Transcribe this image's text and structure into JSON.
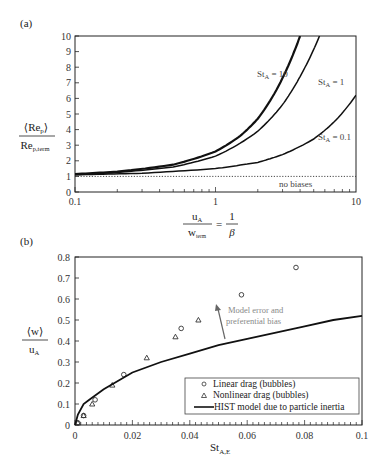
{
  "chart_data": [
    {
      "panel": "(a)",
      "type": "line",
      "xscale": "log",
      "xlim": [
        0.1,
        10
      ],
      "ylim": [
        0,
        10
      ],
      "x_ticks": [
        "0.1",
        "1",
        "10"
      ],
      "y_ticks": [
        "0",
        "1",
        "2",
        "3",
        "4",
        "5",
        "6",
        "7",
        "8",
        "9",
        "10"
      ],
      "ylabel": "⟨Re_p⟩ / Re_p,term",
      "xlabel": "u_A / w_term = 1/β",
      "grid": false,
      "series": [
        {
          "name": "St_A = 10",
          "x": [
            0.1,
            0.2,
            0.5,
            1,
            1.5,
            2,
            3,
            4
          ],
          "y": [
            1.15,
            1.3,
            1.75,
            2.6,
            3.6,
            4.7,
            7.3,
            10
          ]
        },
        {
          "name": "St_A = 1",
          "x": [
            0.1,
            0.2,
            0.5,
            1,
            2,
            3,
            4,
            5.5
          ],
          "y": [
            1.12,
            1.25,
            1.6,
            2.3,
            3.9,
            5.6,
            7.4,
            10
          ]
        },
        {
          "name": "St_A = 0.1",
          "x": [
            0.1,
            0.3,
            1,
            2,
            3,
            5,
            7,
            10
          ],
          "y": [
            1.1,
            1.2,
            1.5,
            1.9,
            2.4,
            3.4,
            4.5,
            6.2
          ]
        },
        {
          "name": "no biases",
          "x": [
            0.1,
            10
          ],
          "y": [
            1,
            1
          ],
          "style": "dotted"
        }
      ],
      "annotations": [
        "St_A = 10",
        "St_A = 1",
        "St_A = 0.1",
        "no biases"
      ]
    },
    {
      "panel": "(b)",
      "type": "scatter",
      "xlim": [
        0,
        0.1
      ],
      "ylim": [
        0,
        0.8
      ],
      "x_ticks": [
        "0",
        "0.02",
        "0.04",
        "0.06",
        "0.08",
        "0.1"
      ],
      "y_ticks": [
        "0",
        "0.1",
        "0.2",
        "0.3",
        "0.4",
        "0.5",
        "0.6",
        "0.7",
        "0.8"
      ],
      "ylabel": "⟨w⟩ / u_A",
      "xlabel": "St_A,E",
      "grid": false,
      "series": [
        {
          "name": "Linear drag (bubbles)",
          "marker": "circle",
          "x": [
            0.001,
            0.003,
            0.007,
            0.017,
            0.037,
            0.058,
            0.077
          ],
          "y": [
            0.01,
            0.045,
            0.12,
            0.24,
            0.46,
            0.62,
            0.75
          ]
        },
        {
          "name": "Nonlinear drag (bubbles)",
          "marker": "triangle",
          "x": [
            0.001,
            0.003,
            0.006,
            0.013,
            0.025,
            0.035,
            0.043
          ],
          "y": [
            0.01,
            0.045,
            0.1,
            0.19,
            0.32,
            0.42,
            0.5
          ]
        },
        {
          "name": "HIST model due to particle inertia",
          "marker": "line",
          "x": [
            0,
            0.001,
            0.003,
            0.005,
            0.01,
            0.02,
            0.03,
            0.04,
            0.05,
            0.06,
            0.07,
            0.08,
            0.09,
            0.1
          ],
          "y": [
            0,
            0.05,
            0.1,
            0.12,
            0.17,
            0.25,
            0.3,
            0.34,
            0.38,
            0.41,
            0.44,
            0.47,
            0.5,
            0.52
          ]
        }
      ],
      "annotations": [
        "Model error and",
        "preferential bias"
      ],
      "legend_position": "lower right"
    }
  ],
  "panel_a": {
    "label": "(a)",
    "y_label_num": "⟨Re",
    "y_label_num_sub": "p",
    "y_label_den": "Re",
    "y_label_den_sub": "p,term",
    "x_label_num": "u",
    "x_label_num_sub": "A",
    "x_label_den": "w",
    "x_label_den_sub": "term",
    "x_label_eq": "=",
    "x_label_rhs_num": "1",
    "x_label_rhs_den": "β",
    "curve_labels": {
      "st10": "St",
      "st10_sub": "A",
      "st10_val": " = 10",
      "st1": "St",
      "st1_sub": "A",
      "st1_val": "  = 1",
      "st01": "St",
      "st01_sub": "A",
      "st01_val": " = 0.1",
      "no_bias": "no biases"
    }
  },
  "panel_b": {
    "label": "(b)",
    "y_label_num": "⟨w⟩",
    "y_label_den": "u",
    "y_label_den_sub": "A",
    "x_label": "St",
    "x_label_sub": "A,E",
    "annotation_line1": "Model error and",
    "annotation_line2": "preferential bias",
    "legend": {
      "item1": "Linear drag (bubbles)",
      "item2": "Nonlinear drag (bubbles)",
      "item3": "HIST model due to particle inertia"
    }
  },
  "colors": {
    "axis": "#222222",
    "curve": "#111111",
    "annotation": "#888888",
    "arrow": "#666666"
  }
}
